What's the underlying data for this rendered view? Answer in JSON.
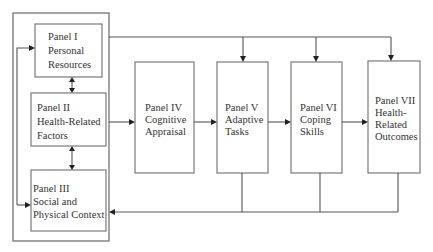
{
  "diagram": {
    "panels": [
      {
        "id": "panel-1",
        "lines": [
          "Panel I",
          "Personal",
          "Resources"
        ]
      },
      {
        "id": "panel-2",
        "lines": [
          "Panel II",
          "Health-Related",
          "Factors"
        ]
      },
      {
        "id": "panel-3",
        "lines": [
          "Panel III",
          "Social and",
          "Physical Context"
        ]
      },
      {
        "id": "panel-4",
        "lines": [
          "Panel IV",
          "Cognitive",
          "Appraisal"
        ]
      },
      {
        "id": "panel-5",
        "lines": [
          "Panel V",
          "Adaptive",
          "Tasks"
        ]
      },
      {
        "id": "panel-6",
        "lines": [
          "Panel VI",
          "Coping",
          "Skills"
        ]
      },
      {
        "id": "panel-7",
        "lines": [
          "Panel VII",
          "Health-",
          "Related",
          "Outcomes"
        ]
      }
    ],
    "edges": [
      {
        "from": "panel-1",
        "to": "panel-2",
        "type": "bidirectional"
      },
      {
        "from": "panel-2",
        "to": "panel-3",
        "type": "bidirectional"
      },
      {
        "from": "group-I-III",
        "to": "panel-4",
        "type": "directed"
      },
      {
        "from": "panel-4",
        "to": "panel-5",
        "type": "directed"
      },
      {
        "from": "panel-5",
        "to": "panel-6",
        "type": "directed"
      },
      {
        "from": "panel-6",
        "to": "panel-7",
        "type": "directed"
      },
      {
        "from": "group-I-III",
        "to": "panel-5",
        "type": "directed",
        "route": "top"
      },
      {
        "from": "group-I-III",
        "to": "panel-6",
        "type": "directed",
        "route": "top"
      },
      {
        "from": "group-I-III",
        "to": "panel-7",
        "type": "directed",
        "route": "top"
      },
      {
        "from": "panel-5",
        "to": "panel-3",
        "type": "feedback",
        "route": "bottom"
      },
      {
        "from": "panel-6",
        "to": "panel-3",
        "type": "feedback",
        "route": "bottom"
      },
      {
        "from": "panel-7",
        "to": "panel-3",
        "type": "feedback",
        "route": "bottom"
      },
      {
        "from": "left-loop",
        "to": "panel-1",
        "type": "directed"
      },
      {
        "from": "left-loop",
        "to": "panel-3",
        "type": "directed"
      }
    ],
    "colors": {
      "box_stroke": "#7a7a7a",
      "line": "#555555",
      "arrow": "#222222",
      "text": "#333333",
      "background": "#ffffff"
    }
  }
}
